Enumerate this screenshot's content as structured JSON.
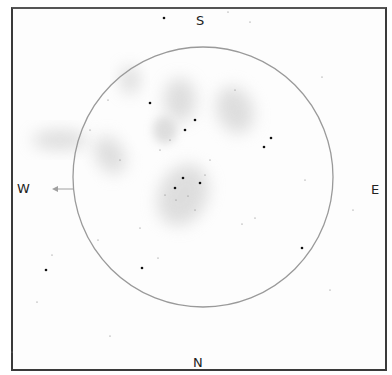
{
  "sketch": {
    "title": "Eyepiece field sketch",
    "frame_color": "#3a3a3a",
    "field_circle": {
      "cx": 203,
      "cy": 177,
      "r": 130,
      "color": "#9a9a9a"
    },
    "cardinals": {
      "south": "S",
      "north": "N",
      "west": "W",
      "east": "E"
    },
    "arrow": {
      "label": "direction-of-drift",
      "color": "#999999"
    },
    "nebulosity_color": "#bdbdbd",
    "bright_stars": [
      [
        164,
        18
      ],
      [
        46,
        270
      ],
      [
        142,
        268
      ],
      [
        302,
        248
      ],
      [
        271,
        138
      ],
      [
        264,
        147
      ],
      [
        183,
        178
      ],
      [
        200,
        183
      ],
      [
        175,
        188
      ],
      [
        195,
        120
      ],
      [
        185,
        130
      ],
      [
        150,
        103
      ]
    ],
    "faint_stars": [
      [
        228,
        12
      ],
      [
        250,
        22
      ],
      [
        90,
        130
      ],
      [
        108,
        100
      ],
      [
        235,
        90
      ],
      [
        322,
        77
      ],
      [
        305,
        180
      ],
      [
        353,
        210
      ],
      [
        140,
        228
      ],
      [
        158,
        258
      ],
      [
        110,
        336
      ],
      [
        12,
        352
      ],
      [
        52,
        255
      ],
      [
        37,
        302
      ],
      [
        255,
        218
      ],
      [
        242,
        224
      ],
      [
        176,
        200
      ],
      [
        188,
        196
      ],
      [
        165,
        195
      ],
      [
        205,
        175
      ],
      [
        195,
        210
      ],
      [
        210,
        160
      ],
      [
        160,
        150
      ],
      [
        170,
        140
      ],
      [
        120,
        160
      ],
      [
        98,
        240
      ],
      [
        330,
        290
      ]
    ]
  }
}
